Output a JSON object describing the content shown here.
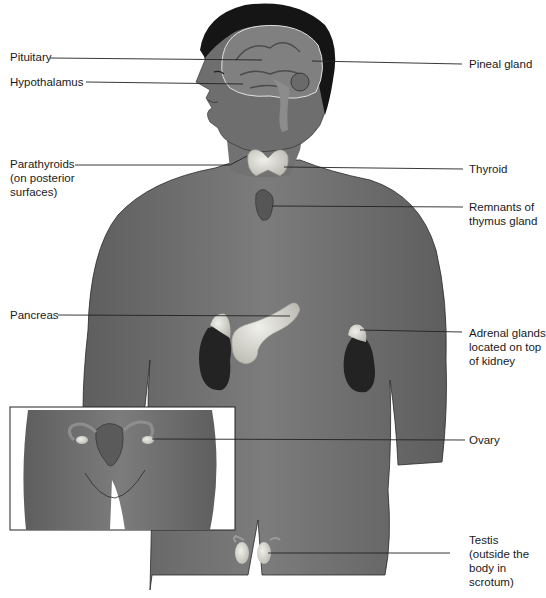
{
  "diagram": {
    "colors": {
      "skin": "#6f6f6f",
      "skin_light": "#8a8a8a",
      "hair": "#151515",
      "kidney": "#232323",
      "gland": "#d9d9d2",
      "leader_line": "#222222",
      "background": "#ffffff"
    },
    "labels_left": [
      {
        "id": "pituitary",
        "text": "Pituitary"
      },
      {
        "id": "hypothalamus",
        "text": "Hypothalamus"
      },
      {
        "id": "parathyroids",
        "text": "Parathyroids\n(on posterior\nsurfaces)"
      },
      {
        "id": "pancreas",
        "text": "Pancreas"
      }
    ],
    "labels_right": [
      {
        "id": "pineal",
        "text": "Pineal gland"
      },
      {
        "id": "thyroid",
        "text": "Thyroid"
      },
      {
        "id": "thymus",
        "text": "Remnants of\nthymus gland"
      },
      {
        "id": "adrenal",
        "text": "Adrenal glands\nlocated on top\nof kidney"
      },
      {
        "id": "ovary",
        "text": "Ovary"
      },
      {
        "id": "testis",
        "text": "Testis\n(outside the\nbody in\nscrotum)"
      }
    ],
    "inset": {
      "description": "Female pelvis inset showing uterus and ovaries"
    }
  }
}
